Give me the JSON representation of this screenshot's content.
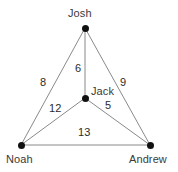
{
  "figure": {
    "type": "weighted-graph-diagram",
    "background_color": "#ffffff",
    "node_color": "#111111",
    "edge_color": "#8a8a8a",
    "label_color": "#3a3a3a",
    "weight_color": "#2b2b2b",
    "width": 178,
    "height": 172
  },
  "nodes": [
    {
      "id": "josh",
      "label": "Josh",
      "x": 85,
      "y": 28,
      "label_x": 68,
      "label_y": 7
    },
    {
      "id": "jack",
      "label": "Jack",
      "x": 85,
      "y": 98,
      "label_x": 91,
      "label_y": 85
    },
    {
      "id": "noah",
      "label": "Noah",
      "x": 21,
      "y": 145,
      "label_x": 6,
      "label_y": 153
    },
    {
      "id": "andrew",
      "label": "Andrew",
      "x": 150,
      "y": 145,
      "label_x": 129,
      "label_y": 153
    }
  ],
  "edges": [
    {
      "id": "josh-noah",
      "from": "josh",
      "to": "noah",
      "weight": "8",
      "label_x": 40,
      "label_y": 76
    },
    {
      "id": "josh-jack",
      "from": "josh",
      "to": "jack",
      "weight": "6",
      "label_x": 75,
      "label_y": 62
    },
    {
      "id": "josh-andrew",
      "from": "josh",
      "to": "andrew",
      "weight": "9",
      "label_x": 120,
      "label_y": 76
    },
    {
      "id": "noah-jack",
      "from": "noah",
      "to": "jack",
      "weight": "12",
      "label_x": 49,
      "label_y": 102
    },
    {
      "id": "jack-andrew",
      "from": "jack",
      "to": "andrew",
      "weight": "5",
      "label_x": 105,
      "label_y": 99
    },
    {
      "id": "noah-andrew",
      "from": "noah",
      "to": "andrew",
      "weight": "13",
      "label_x": 78,
      "label_y": 126
    }
  ]
}
